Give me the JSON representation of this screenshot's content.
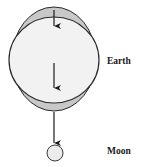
{
  "diagram": {
    "labels": {
      "earth": "Earth",
      "moon": "Moon"
    },
    "colors": {
      "bulge_fill": "#c8c8c8",
      "earth_fill": "#f2f2f2",
      "moon_fill": "#ececec",
      "stroke": "#2a2a2a"
    },
    "arrows": [
      {
        "name": "arrow-top-bulge",
        "direction": "down"
      },
      {
        "name": "arrow-earth-center",
        "direction": "down"
      },
      {
        "name": "arrow-bottom-bulge",
        "direction": "down"
      }
    ]
  }
}
